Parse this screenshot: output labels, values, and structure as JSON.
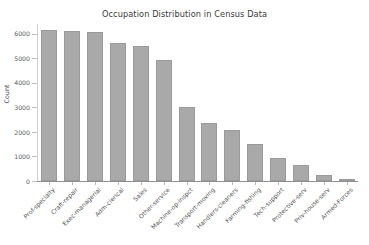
{
  "chart_data": {
    "type": "bar",
    "title": "Occupation Distribution in Census Data",
    "xlabel": "",
    "ylabel": "Count",
    "ylim": [
      0,
      6400
    ],
    "yticks": [
      0,
      1000,
      2000,
      3000,
      4000,
      5000,
      6000
    ],
    "ytick_labels": [
      "0",
      "1000",
      "2000",
      "3000",
      "4000",
      "5000",
      "6000"
    ],
    "grid": false,
    "legend": "none",
    "bar_color": "#a9a9a9",
    "categories": [
      "Prof-specialty",
      "Craft-repair",
      "Exec-managerial",
      "Adm-clerical",
      "Sales",
      "Other-service",
      "Machine-op-inspct",
      "Transport-moving",
      "Handlers-cleaners",
      "Farming-fishing",
      "Tech-support",
      "Protective-serv",
      "Priv-house-serv",
      "Armed-Forces"
    ],
    "values": [
      6172,
      6112,
      6086,
      5611,
      5504,
      4923,
      3022,
      2355,
      2072,
      1490,
      928,
      649,
      242,
      9
    ]
  }
}
